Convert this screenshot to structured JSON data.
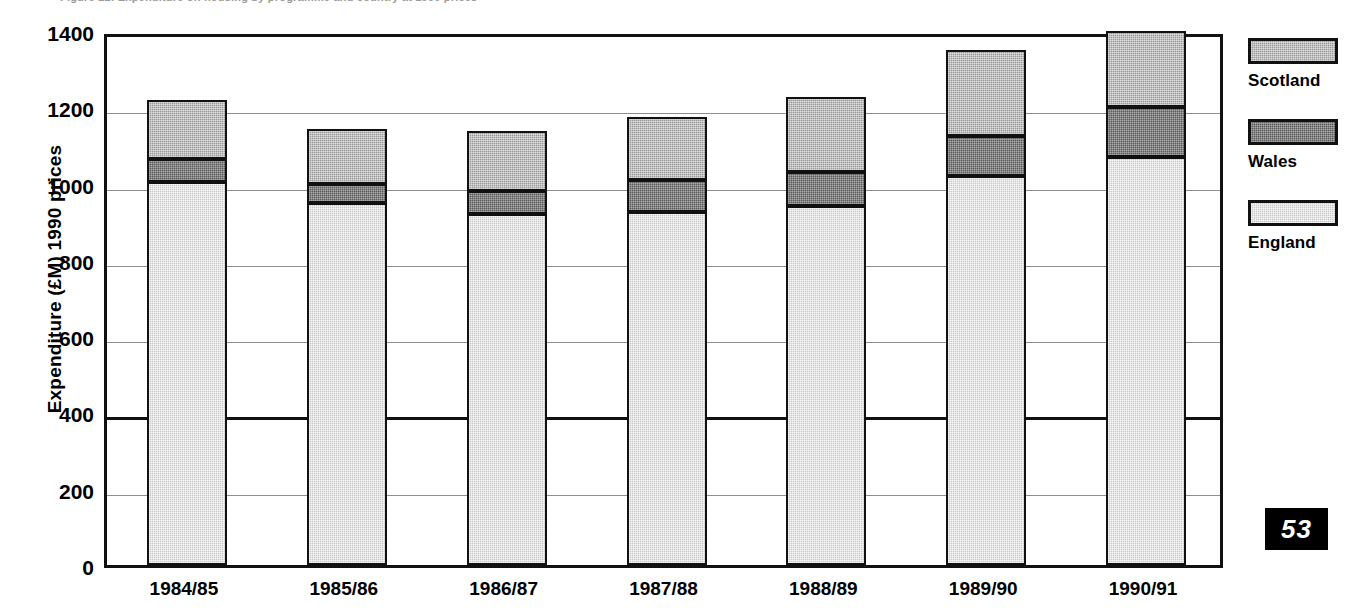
{
  "figure": {
    "caption_sliver": "Figure 12: Expenditure on housing by programme and country at 1990 prices",
    "page_number": "53"
  },
  "chart_data": {
    "type": "bar",
    "stacked": true,
    "title": "",
    "xlabel": "",
    "ylabel": "Expenditure (£M) 1990 prices",
    "ylim": [
      0,
      1400
    ],
    "ytick_step": 200,
    "yticks": [
      "0",
      "200",
      "400",
      "600",
      "800",
      "1000",
      "1200",
      "1400"
    ],
    "grid": true,
    "legend_position": "right",
    "categories": [
      "1984/85",
      "1985/86",
      "1986/87",
      "1987/88",
      "1988/89",
      "1989/90",
      "1990/91"
    ],
    "series": [
      {
        "name": "England",
        "color": "#c9c9c9",
        "values": [
          1005,
          948,
          920,
          925,
          940,
          1020,
          1070
        ]
      },
      {
        "name": "Wales",
        "color": "#5c5c5c",
        "values": [
          60,
          52,
          60,
          85,
          90,
          105,
          130
        ]
      },
      {
        "name": "Scotland",
        "color": "#9a9a9a",
        "values": [
          153,
          142,
          158,
          165,
          198,
          225,
          200
        ]
      }
    ],
    "totals": [
      1218,
      1142,
      1138,
      1175,
      1228,
      1350,
      1400
    ]
  },
  "legend": {
    "entries": [
      {
        "label": "Scotland",
        "color": "#9a9a9a"
      },
      {
        "label": "Wales",
        "color": "#5c5c5c"
      },
      {
        "label": "England",
        "color": "#c9c9c9"
      }
    ]
  }
}
